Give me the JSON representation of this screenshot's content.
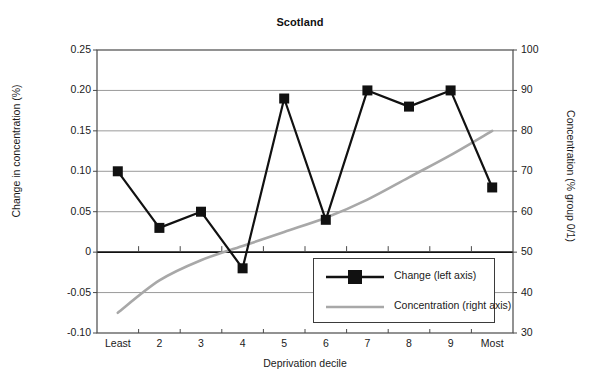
{
  "chart_data": {
    "type": "line",
    "title": "Scotland",
    "xlabel": "Deprivation decile",
    "ylabel": "Change in concentration (%)",
    "ylabel_right": "Concentration (% group 0/1)",
    "grid": true,
    "legend_position": "inside-bottom-right",
    "categories": [
      "Least",
      "2",
      "3",
      "4",
      "5",
      "6",
      "7",
      "8",
      "9",
      "Most"
    ],
    "y_ticks_left": [
      "0.25",
      "0.20",
      "0.15",
      "0.10",
      "0.05",
      "0",
      "-0.05",
      "-0.10"
    ],
    "y_tick_values_left": [
      0.25,
      0.2,
      0.15,
      0.1,
      0.05,
      0,
      -0.05,
      -0.1
    ],
    "ylim_left": [
      -0.1,
      0.25
    ],
    "y_ticks_right": [
      "100",
      "90",
      "80",
      "70",
      "60",
      "50",
      "40",
      "30"
    ],
    "y_tick_values_right": [
      100,
      90,
      80,
      70,
      60,
      50,
      40,
      30
    ],
    "ylim_right": [
      30,
      100
    ],
    "series": [
      {
        "name": "Change (left axis)",
        "axis": "left",
        "color": "#111111",
        "marker": "square",
        "values": [
          0.1,
          0.03,
          0.05,
          -0.02,
          0.19,
          0.04,
          0.2,
          0.18,
          0.2,
          0.08
        ]
      },
      {
        "name": "Concentration (right axis)",
        "axis": "right",
        "color": "#a8a8a8",
        "marker": "none",
        "values": [
          35,
          43,
          48,
          51.5,
          55,
          58.5,
          63,
          68.5,
          74,
          80
        ]
      }
    ]
  },
  "legend": {
    "items": [
      {
        "label": "Change (left axis)",
        "color": "#111111",
        "marker": "square"
      },
      {
        "label": "Concentration (right axis)",
        "color": "#a8a8a8",
        "marker": "none"
      }
    ]
  }
}
